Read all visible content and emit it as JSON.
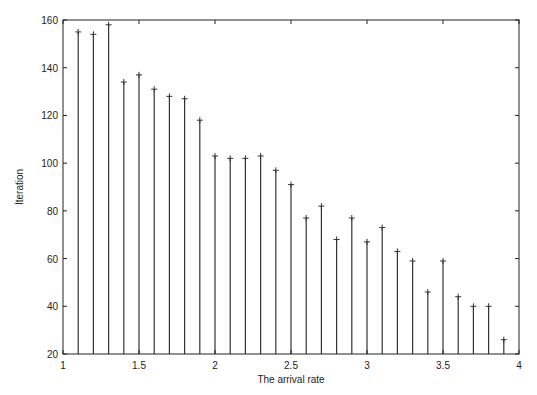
{
  "chart_data": {
    "type": "stem",
    "title": "",
    "xlabel": "The arrival rate",
    "ylabel": "Iteration",
    "xlim": [
      1,
      4
    ],
    "ylim": [
      20,
      160
    ],
    "xticks": [
      1,
      1.5,
      2,
      2.5,
      3,
      3.5,
      4
    ],
    "xtick_labels": [
      "1",
      "1.5",
      "2",
      "2.5",
      "3",
      "3.5",
      "4"
    ],
    "yticks": [
      20,
      40,
      60,
      80,
      100,
      120,
      140,
      160
    ],
    "ytick_labels": [
      "20",
      "40",
      "60",
      "80",
      "100",
      "120",
      "140",
      "160"
    ],
    "grid": false,
    "legend": null,
    "marker": "+",
    "x": [
      1.1,
      1.2,
      1.3,
      1.4,
      1.5,
      1.6,
      1.7,
      1.8,
      1.9,
      2.0,
      2.1,
      2.2,
      2.3,
      2.4,
      2.5,
      2.6,
      2.7,
      2.8,
      2.9,
      3.0,
      3.1,
      3.2,
      3.3,
      3.4,
      3.5,
      3.6,
      3.7,
      3.8,
      3.9
    ],
    "values": [
      155,
      154,
      158,
      134,
      137,
      131,
      128,
      127,
      118,
      103,
      102,
      102,
      103,
      97,
      91,
      77,
      82,
      68,
      77,
      67,
      73,
      63,
      59,
      46,
      59,
      44,
      40,
      40,
      26
    ]
  },
  "colors": {
    "axis": "#222222",
    "stem": "#333333",
    "background": "#ffffff"
  }
}
